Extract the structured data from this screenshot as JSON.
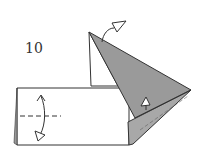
{
  "diagram": {
    "step_number": "10",
    "colors": {
      "paper_white": "#ffffff",
      "paper_colored": "#9a9a9a",
      "outline": "#333333"
    },
    "elements": [
      {
        "name": "rectangle-base",
        "type": "white-paper"
      },
      {
        "name": "white-triangle-upper",
        "type": "white-paper"
      },
      {
        "name": "gray-flap-large",
        "type": "colored-paper"
      },
      {
        "name": "gray-flap-lower",
        "type": "colored-paper"
      },
      {
        "name": "valley-fold-line",
        "type": "dashed-line"
      },
      {
        "name": "fold-arrow-vertical",
        "type": "arrow"
      },
      {
        "name": "curved-arrow-top",
        "type": "arrow"
      },
      {
        "name": "push-arrow-inner",
        "type": "arrow"
      }
    ]
  }
}
